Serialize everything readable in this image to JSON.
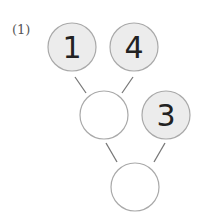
{
  "problem": {
    "label": "(1)",
    "nodes": [
      {
        "id": "a",
        "value": "1",
        "filled": true
      },
      {
        "id": "b",
        "value": "4",
        "filled": true
      },
      {
        "id": "c",
        "value": "",
        "filled": false
      },
      {
        "id": "d",
        "value": "3",
        "filled": true
      },
      {
        "id": "e",
        "value": "",
        "filled": false
      }
    ],
    "colors": {
      "filled": "#ececec",
      "stroke": "#a9a9a9",
      "line": "#777777"
    }
  }
}
